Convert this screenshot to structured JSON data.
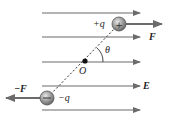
{
  "diagram": {
    "labels": {
      "positive_charge": "+q",
      "negative_charge": "−q",
      "force_positive": "F",
      "force_negative": "−F",
      "angle": "θ",
      "pivot": "O",
      "field": "E"
    },
    "field_lines_y": [
      13,
      37,
      62,
      86,
      110
    ],
    "positive_charge_pos": [
      119,
      24
    ],
    "negative_charge_pos": [
      47,
      98
    ],
    "pivot_pos": [
      85,
      61
    ],
    "colors": {
      "line": "#6b6b6b",
      "charge_fill": "#9a9a9a",
      "text": "#222222"
    }
  }
}
